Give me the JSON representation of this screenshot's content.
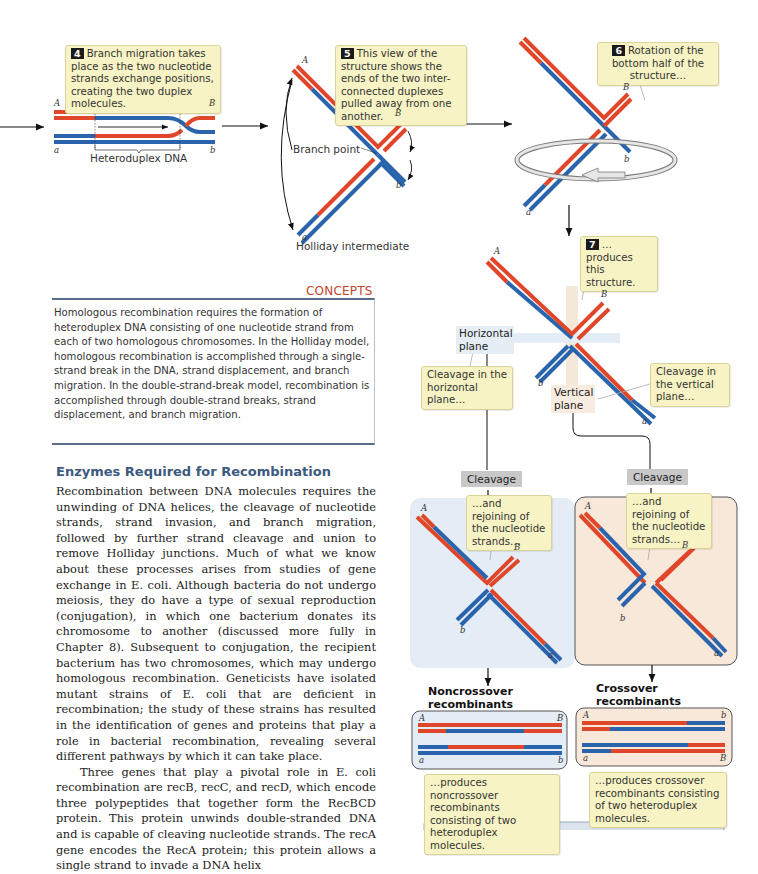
{
  "figure": {
    "step4": {
      "number": "4",
      "text": "Branch migration takes place as the two nucleotide strands exchange positions, creating the two duplex molecules."
    },
    "step5": {
      "number": "5",
      "text": "This view of the structure shows the ends of the two inter-connected duplexes pulled away from one another."
    },
    "step6": {
      "number": "6",
      "text": "Rotation of the bottom half of the structure…"
    },
    "step7": {
      "number": "7",
      "text": "…produces this structure."
    },
    "heteroduplex_label": "Heteroduplex DNA",
    "branch_point_label": "Branch point",
    "holliday_label": "Holliday intermediate",
    "strand_labels": {
      "A": "A",
      "B": "B",
      "a": "a",
      "b": "b"
    },
    "horizontal_plane_label": "Horizontal plane",
    "vertical_plane_label": "Vertical plane",
    "cleavage_horizontal": "Cleavage in the horizontal plane…",
    "cleavage_vertical": "Cleavage in the vertical plane…",
    "cleavage_button": "Cleavage",
    "rejoining_text": "…and rejoining of the nucleotide strands…",
    "noncrossover_title": "Noncrossover recombinants",
    "crossover_title": "Crossover recombinants",
    "noncrossover_caption": "…produces noncrossover recombinants consisting of two heteroduplex molecules.",
    "crossover_caption": "…produces crossover recombinants consisting of two heteroduplex molecules.",
    "colors": {
      "red": "#e0472a",
      "blue": "#2a64ad",
      "callout": "#f7f3c4",
      "blue_panel": "#e4ecf5",
      "peach_panel": "#f8e8da"
    }
  },
  "concepts": {
    "title": "CONCEPTS",
    "text": "Homologous recombination requires the formation of heteroduplex DNA consisting of one nucleotide strand from each of two homologous chromosomes. In the Holliday model, homologous recombination is accomplished through a single-strand break in the DNA, strand displacement, and branch migration. In the double-strand-break model, recombination is accomplished through double-strand breaks, strand displacement, and branch migration."
  },
  "section": {
    "heading": "Enzymes Required for Recombination",
    "p1": "Recombination between DNA molecules requires the unwinding of DNA helices, the cleavage of nucleotide strands, strand invasion, and branch migration, followed by further strand cleavage and union to remove Holliday junctions. Much of what we know about these processes arises from studies of gene exchange in E. coli. Although bacteria do not undergo meiosis, they do have a type of sexual reproduction (conjugation), in which one bacterium donates its chromosome to another (discussed more fully in Chapter 8). Subsequent to conjugation, the recipient bacterium has two chromosomes, which may undergo homologous recombination. Geneticists have isolated mutant strains of E. coli that are deficient in recombination; the study of these strains has resulted in the identification of genes and proteins that play a role in bacterial recombination, revealing several different pathways by which it can take place.",
    "p2": "Three genes that play a pivotal role in E. coli recombination are recB, recC, and recD, which encode three polypeptides that together form the RecBCD protein. This protein unwinds double-stranded DNA and is capable of cleaving nucleotide strands. The recA gene encodes the RecA protein; this protein allows a single strand to invade a DNA helix"
  }
}
